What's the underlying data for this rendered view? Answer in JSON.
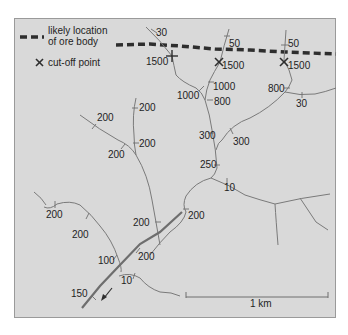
{
  "legend": {
    "ore_body_label_line1": "likely location",
    "ore_body_label_line2": "of ore body",
    "cutoff_symbol": "×",
    "cutoff_label": "cut-off point"
  },
  "scale_bar": {
    "label": "1 km"
  },
  "sample_values": {
    "s30_top": "30",
    "s1500_left": "1500",
    "s50_mid": "50",
    "s1500_mid": "1500",
    "s50_right": "50",
    "s1500_right": "1500",
    "s1000_a": "1000",
    "s1000_b": "1000",
    "s800_a": "800",
    "s800_right": "800",
    "s30_right": "30",
    "s300_a": "300",
    "s300_b": "300",
    "s250": "250",
    "s10_a": "10",
    "s200_1": "200",
    "s200_2": "200",
    "s200_3": "200",
    "s200_4": "200",
    "s200_5": "200",
    "s200_6": "200",
    "s200_7": "200",
    "s200_8": "200",
    "s200_9": "200",
    "s100": "100",
    "s10_b": "10",
    "s150": "150"
  },
  "colors": {
    "background": "#d9d9d9",
    "river": "#7a7a7a",
    "ore_line": "#2e2e2e",
    "text": "#1e1e1e"
  }
}
